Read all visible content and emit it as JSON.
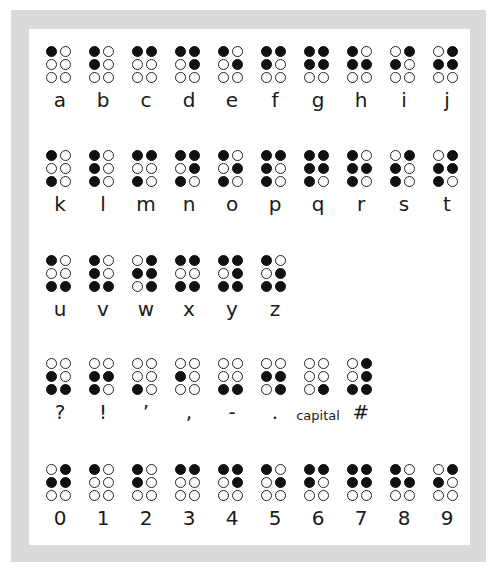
{
  "colors": {
    "frame": "#dadada",
    "panel": "#ffffff",
    "dot_filled": "#111111",
    "dot_empty": "#ffffff"
  },
  "dot_numbering": "1 2 / 3 4 / 5 6 read as left-top, right-top, left-mid, right-mid, left-bottom, right-bottom",
  "rows": [
    {
      "name": "letters-a-j",
      "cells": [
        {
          "label": "a",
          "dots": [
            1,
            0,
            0,
            0,
            0,
            0
          ]
        },
        {
          "label": "b",
          "dots": [
            1,
            0,
            1,
            0,
            0,
            0
          ]
        },
        {
          "label": "c",
          "dots": [
            1,
            1,
            0,
            0,
            0,
            0
          ]
        },
        {
          "label": "d",
          "dots": [
            1,
            1,
            0,
            1,
            0,
            0
          ]
        },
        {
          "label": "e",
          "dots": [
            1,
            0,
            0,
            1,
            0,
            0
          ]
        },
        {
          "label": "f",
          "dots": [
            1,
            1,
            1,
            0,
            0,
            0
          ]
        },
        {
          "label": "g",
          "dots": [
            1,
            1,
            1,
            1,
            0,
            0
          ]
        },
        {
          "label": "h",
          "dots": [
            1,
            0,
            1,
            1,
            0,
            0
          ]
        },
        {
          "label": "i",
          "dots": [
            0,
            1,
            1,
            0,
            0,
            0
          ]
        },
        {
          "label": "j",
          "dots": [
            0,
            1,
            1,
            1,
            0,
            0
          ]
        }
      ]
    },
    {
      "name": "letters-k-t",
      "cells": [
        {
          "label": "k",
          "dots": [
            1,
            0,
            0,
            0,
            1,
            0
          ]
        },
        {
          "label": "l",
          "dots": [
            1,
            0,
            1,
            0,
            1,
            0
          ]
        },
        {
          "label": "m",
          "dots": [
            1,
            1,
            0,
            0,
            1,
            0
          ]
        },
        {
          "label": "n",
          "dots": [
            1,
            1,
            0,
            1,
            1,
            0
          ]
        },
        {
          "label": "o",
          "dots": [
            1,
            0,
            0,
            1,
            1,
            0
          ]
        },
        {
          "label": "p",
          "dots": [
            1,
            1,
            1,
            0,
            1,
            0
          ]
        },
        {
          "label": "q",
          "dots": [
            1,
            1,
            1,
            1,
            1,
            0
          ]
        },
        {
          "label": "r",
          "dots": [
            1,
            0,
            1,
            1,
            1,
            0
          ]
        },
        {
          "label": "s",
          "dots": [
            0,
            1,
            1,
            0,
            1,
            0
          ]
        },
        {
          "label": "t",
          "dots": [
            0,
            1,
            1,
            1,
            1,
            0
          ]
        }
      ]
    },
    {
      "name": "letters-u-z",
      "cells": [
        {
          "label": "u",
          "dots": [
            1,
            0,
            0,
            0,
            1,
            1
          ]
        },
        {
          "label": "v",
          "dots": [
            1,
            0,
            1,
            0,
            1,
            1
          ]
        },
        {
          "label": "w",
          "dots": [
            0,
            1,
            1,
            1,
            0,
            1
          ]
        },
        {
          "label": "x",
          "dots": [
            1,
            1,
            0,
            0,
            1,
            1
          ]
        },
        {
          "label": "y",
          "dots": [
            1,
            1,
            0,
            1,
            1,
            1
          ]
        },
        {
          "label": "z",
          "dots": [
            1,
            0,
            0,
            1,
            1,
            1
          ]
        }
      ]
    },
    {
      "name": "punctuation",
      "cells": [
        {
          "label": "?",
          "dots": [
            0,
            0,
            1,
            0,
            1,
            1
          ]
        },
        {
          "label": "!",
          "dots": [
            0,
            0,
            1,
            1,
            1,
            0
          ]
        },
        {
          "label": "’",
          "dots": [
            0,
            0,
            0,
            0,
            1,
            0
          ]
        },
        {
          "label": ",",
          "dots": [
            0,
            0,
            1,
            0,
            0,
            0
          ]
        },
        {
          "label": "-",
          "dots": [
            0,
            0,
            0,
            0,
            1,
            1
          ]
        },
        {
          "label": ".",
          "dots": [
            0,
            0,
            1,
            1,
            0,
            1
          ]
        },
        {
          "label": "capital",
          "dots": [
            0,
            0,
            0,
            0,
            0,
            1
          ]
        },
        {
          "label": "#",
          "dots": [
            0,
            1,
            0,
            1,
            1,
            1
          ]
        }
      ]
    },
    {
      "name": "digits",
      "cells": [
        {
          "label": "0",
          "dots": [
            0,
            1,
            1,
            1,
            0,
            0
          ]
        },
        {
          "label": "1",
          "dots": [
            1,
            0,
            0,
            0,
            0,
            0
          ]
        },
        {
          "label": "2",
          "dots": [
            1,
            0,
            1,
            0,
            0,
            0
          ]
        },
        {
          "label": "3",
          "dots": [
            1,
            1,
            0,
            0,
            0,
            0
          ]
        },
        {
          "label": "4",
          "dots": [
            1,
            1,
            0,
            1,
            0,
            0
          ]
        },
        {
          "label": "5",
          "dots": [
            1,
            0,
            0,
            1,
            0,
            0
          ]
        },
        {
          "label": "6",
          "dots": [
            1,
            1,
            1,
            0,
            0,
            0
          ]
        },
        {
          "label": "7",
          "dots": [
            1,
            1,
            1,
            1,
            0,
            0
          ]
        },
        {
          "label": "8",
          "dots": [
            1,
            0,
            1,
            1,
            0,
            0
          ]
        },
        {
          "label": "9",
          "dots": [
            0,
            1,
            1,
            0,
            0,
            0
          ]
        }
      ]
    }
  ]
}
